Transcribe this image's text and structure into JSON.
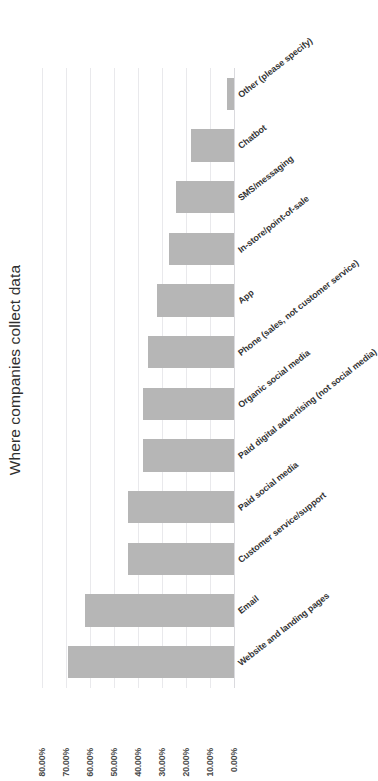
{
  "chart_data": {
    "type": "bar",
    "title": "Where companies collect data",
    "xlabel": "",
    "ylabel": "",
    "ylim": [
      0,
      0.8
    ],
    "grid": true,
    "legend": false,
    "orientation": "vertical-bars-rotated-canvas",
    "value_format": "percent-2dp",
    "tick_labels": [
      "80.00%",
      "70.00%",
      "60.00%",
      "50.00%",
      "40.00%",
      "30.00%",
      "20.00%",
      "10.00%",
      "0.00%"
    ],
    "tick_values": [
      0.8,
      0.7,
      0.6,
      0.5,
      0.4,
      0.3,
      0.2,
      0.1,
      0.0
    ],
    "categories": [
      "Website and landing pages",
      "Email",
      "Customer service/support",
      "Paid social media",
      "Paid digital advertising (not social media)",
      "Organic social media",
      "Phone (sales, not customer service)",
      "App",
      "In-store/point-of-sale",
      "SMS/messaging",
      "Chatbot",
      "Other (please specify)"
    ],
    "values": [
      0.69,
      0.62,
      0.44,
      0.44,
      0.38,
      0.38,
      0.36,
      0.32,
      0.27,
      0.24,
      0.18,
      0.03
    ],
    "value_labels": [
      "69.00%",
      "62.00%",
      "44.00%",
      "44.00%",
      "38.00%",
      "38.00%",
      "36.00%",
      "32.00%",
      "27.00%",
      "24.00%",
      "18.00%",
      "3.00%"
    ],
    "bar_color": "#b6b6b6",
    "gridline_color": "#e9e9ec",
    "background": "#ffffff"
  }
}
